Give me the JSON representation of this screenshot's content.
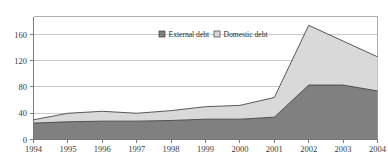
{
  "chart_data": {
    "type": "area",
    "stacked": true,
    "title": "",
    "subtitle": "",
    "xlabel": "",
    "ylabel": "",
    "categories": [
      "1994",
      "1995",
      "1996",
      "1997",
      "1998",
      "1999",
      "2000",
      "2001",
      "2002",
      "2003",
      "2004"
    ],
    "x": [
      1994,
      1995,
      1996,
      1997,
      1998,
      1999,
      2000,
      2001,
      2002,
      2003,
      2004
    ],
    "series": [
      {
        "name": "External debt",
        "color": "#808080",
        "values": [
          25,
          27,
          28,
          28,
          29,
          31,
          31,
          34,
          83,
          83,
          74
        ]
      },
      {
        "name": "Domestic debt",
        "color": "#d9d9d9",
        "values": [
          5,
          13,
          15,
          12,
          15,
          19,
          21,
          30,
          91,
          67,
          52
        ]
      }
    ],
    "totals": [
      30,
      40,
      43,
      40,
      44,
      50,
      52,
      64,
      174,
      150,
      126
    ],
    "ylim": [
      0,
      180
    ],
    "yticks": [
      0,
      40,
      80,
      120,
      160
    ],
    "ytick_labels": [
      "0",
      "40",
      "80",
      "120",
      "160"
    ],
    "xtick_labels": [
      "1994",
      "1995",
      "1996",
      "1997",
      "1998",
      "1999",
      "2000",
      "2001",
      "2002",
      "2003",
      "2004"
    ],
    "grid": true,
    "grid_axis": "y",
    "legend_position": "top-center",
    "legend": [
      "External debt",
      "Domestic debt"
    ]
  },
  "legend": {
    "items": [
      {
        "label": "External debt",
        "swatch": "#808080"
      },
      {
        "label": "Domestic debt",
        "swatch": "#d9d9d9"
      }
    ]
  },
  "axes": {
    "y_tick_labels": [
      "160",
      "120",
      "80",
      "40",
      "0"
    ],
    "x_tick_labels": [
      "1994",
      "1995",
      "1996",
      "1997",
      "1998",
      "1999",
      "2000",
      "2001",
      "2002",
      "2003",
      "2004"
    ]
  },
  "colors": {
    "external_debt": "#808080",
    "domestic_debt": "#d9d9d9",
    "outline": "#3d3d3d",
    "gridline": "#b4b4b4",
    "frame": "#9a9a9a",
    "background": "#ffffff"
  }
}
